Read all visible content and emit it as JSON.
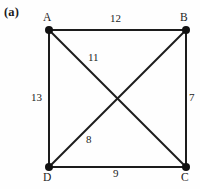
{
  "figure": {
    "panel_label": "(a)",
    "background_color": "#fefefe",
    "stroke_color": "#1c1c1c"
  },
  "graph": {
    "vertices": [
      {
        "id": "A",
        "label": "A",
        "x": 49,
        "y": 30
      },
      {
        "id": "B",
        "label": "B",
        "x": 186,
        "y": 30
      },
      {
        "id": "C",
        "label": "C",
        "x": 186,
        "y": 167
      },
      {
        "id": "D",
        "label": "D",
        "x": 49,
        "y": 167
      }
    ],
    "edges": [
      {
        "id": "AB",
        "from": "A",
        "to": "B",
        "weight": "12"
      },
      {
        "id": "AD",
        "from": "A",
        "to": "D",
        "weight": "13"
      },
      {
        "id": "BC",
        "from": "B",
        "to": "C",
        "weight": "7"
      },
      {
        "id": "DC",
        "from": "D",
        "to": "C",
        "weight": "9"
      },
      {
        "id": "AC",
        "from": "A",
        "to": "C",
        "weight": "11"
      },
      {
        "id": "DB",
        "from": "D",
        "to": "B",
        "weight": "8"
      }
    ]
  }
}
